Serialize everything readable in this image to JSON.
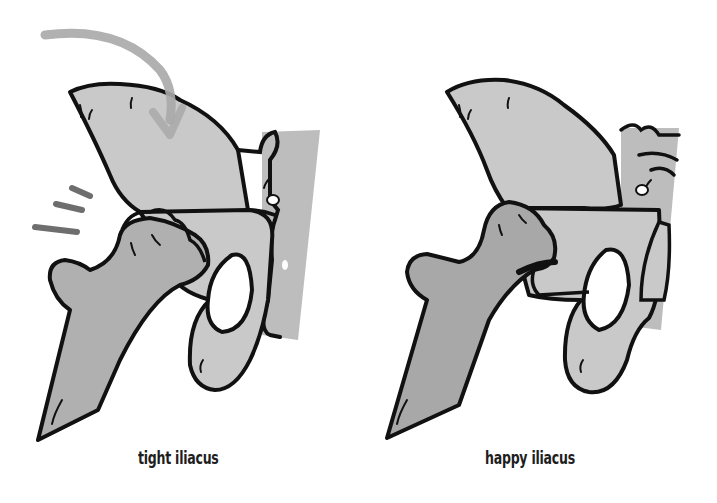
{
  "figure": {
    "panels": [
      {
        "id": "left",
        "caption": "tight iliacus",
        "state": "tight",
        "annotations": [
          "curved-arrow-pulling-down",
          "motion-lines"
        ]
      },
      {
        "id": "right",
        "caption": "happy iliacus",
        "state": "relaxed",
        "annotations": []
      }
    ],
    "colors": {
      "bone_fill": "#c9c9c9",
      "femur_fill": "#a8a8a8",
      "sacrum_fill": "#bdbdbd",
      "outline": "#111111",
      "arrow": "#a9a9a9",
      "motion_lines": "#6e6e6e",
      "background": "#ffffff"
    }
  }
}
